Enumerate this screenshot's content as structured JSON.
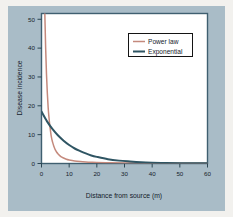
{
  "figure": {
    "panel_background": "#a9bcc7",
    "outer_background": "#f2f1ee",
    "plot_background": "#ffffff",
    "frame_color": "#3f5f70"
  },
  "chart_data": {
    "type": "line",
    "title": "",
    "xlabel": "Distance from source (m)",
    "ylabel": "Disease incidence",
    "xlim": [
      0,
      60
    ],
    "ylim": [
      0,
      52
    ],
    "xticks": [
      0,
      10,
      20,
      30,
      40,
      50,
      60
    ],
    "yticks": [
      0,
      10,
      20,
      30,
      40,
      50
    ],
    "grid": false,
    "legend_position": "upper right",
    "series": [
      {
        "name": "Power law",
        "color": "#c4897c",
        "x": [
          0.9,
          1.2,
          1.5,
          1.8,
          2.1,
          2.4,
          2.7,
          3.0,
          3.5,
          4.0,
          4.5,
          5.0,
          5.5,
          6.0,
          7.0,
          8.0,
          9.0,
          10.0,
          12.0,
          14.0,
          16.0,
          18.0,
          20.0,
          25.0,
          30.0,
          35.0,
          40.0,
          45.0,
          50.0,
          55.0,
          60.0
        ],
        "values": [
          62.0,
          52.0,
          40.0,
          31.0,
          24.5,
          19.5,
          16.0,
          13.2,
          9.6,
          7.4,
          5.9,
          4.7,
          3.9,
          3.3,
          2.4,
          1.9,
          1.5,
          1.25,
          0.9,
          0.68,
          0.53,
          0.43,
          0.36,
          0.25,
          0.18,
          0.14,
          0.11,
          0.09,
          0.08,
          0.07,
          0.06
        ]
      },
      {
        "name": "Exponential",
        "color": "#2f5563",
        "x": [
          0,
          2,
          4,
          6,
          8,
          10,
          12,
          14,
          16,
          18,
          20,
          24,
          28,
          32,
          36,
          40,
          45,
          50,
          55,
          60
        ],
        "values": [
          18.0,
          14.6,
          11.9,
          9.7,
          7.9,
          6.4,
          5.2,
          4.3,
          3.5,
          2.8,
          2.3,
          1.5,
          1.0,
          0.7,
          0.45,
          0.3,
          0.18,
          0.11,
          0.07,
          0.05
        ]
      }
    ]
  },
  "legend": {
    "entries": [
      {
        "label": "Power law",
        "color": "#c4897c"
      },
      {
        "label": "Exponential",
        "color": "#2f5563"
      }
    ]
  },
  "axes": {
    "x_tick_labels": [
      "0",
      "10",
      "20",
      "30",
      "40",
      "50",
      "60"
    ],
    "y_tick_labels": [
      "0",
      "10",
      "20",
      "30",
      "40",
      "50"
    ],
    "x_title": "Distance from source (m)",
    "y_title": "Disease incidence"
  }
}
